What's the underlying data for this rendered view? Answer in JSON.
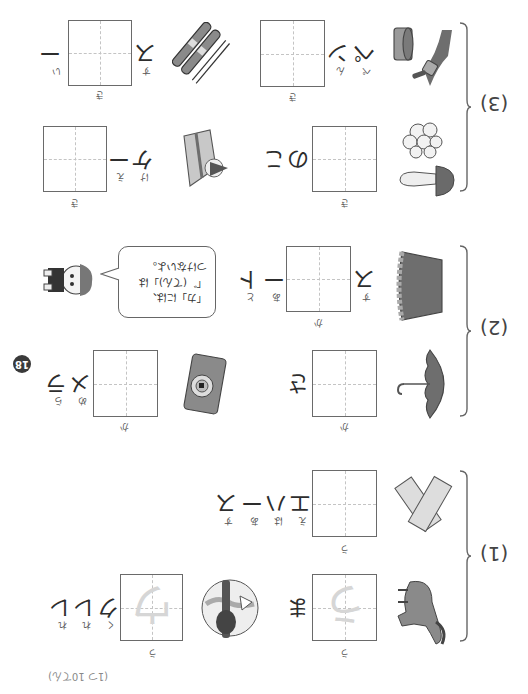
{
  "page": {
    "number": "18",
    "orientation": "rotated-180",
    "score_note": "(1つ 10てん)"
  },
  "sections": [
    {
      "label": "(1)",
      "items": [
        {
          "word": "ウま",
          "answer_kana": "ウ",
          "given": [
            "ま"
          ],
          "ruby_box": "う",
          "ruby_given": [
            ""
          ],
          "picture": "horse",
          "guide_glyph": "う"
        },
        {
          "word": "ウエハース",
          "answer_kana": "ウ",
          "given": [
            "エ",
            "ハ",
            "ー",
            "ス"
          ],
          "ruby_box": "う",
          "ruby_given": [
            "え",
            "は",
            "あ",
            "す"
          ],
          "picture": "wafers"
        },
        {
          "word": "ウクレレ",
          "answer_kana": "ウ",
          "given": [
            "ク",
            "レ",
            "レ"
          ],
          "ruby_box": "う",
          "ruby_given": [
            "く",
            "れ",
            "れ"
          ],
          "picture": "ukulele-player",
          "guide_glyph": "ウ"
        }
      ]
    },
    {
      "label": "(2)",
      "items": [
        {
          "word": "カさ",
          "answer_kana": "カ",
          "given": [
            "さ"
          ],
          "ruby_box": "か",
          "ruby_given": [
            ""
          ],
          "picture": "umbrella"
        },
        {
          "word": "スカート",
          "answer_kana": "カ",
          "given": [
            "ス",
            "ー",
            "ト"
          ],
          "ruby_box": "か",
          "ruby_given": [
            "す",
            "あ",
            "と"
          ],
          "picture": "skirt"
        },
        {
          "word": "カメラ",
          "answer_kana": "カ",
          "given": [
            "メ",
            "ラ"
          ],
          "ruby_box": "か",
          "ruby_given": [
            "め",
            "ら"
          ],
          "picture": "camera"
        }
      ],
      "speech_bubble": {
        "lines": [
          "「カ」には、",
          "「゛(てん)」は",
          "つけないよ。"
        ],
        "speaker": "child-character"
      }
    },
    {
      "label": "(3)",
      "items": [
        {
          "word": "キのこ",
          "answer_kana": "キ",
          "given": [
            "の",
            "こ"
          ],
          "ruby_box": "き",
          "ruby_given": [
            "",
            ""
          ],
          "picture": "mushrooms"
        },
        {
          "word": "ペンキ",
          "answer_kana": "キ",
          "given": [
            "ペ",
            "ン"
          ],
          "ruby_box": "き",
          "ruby_given": [
            "ぺ",
            "ん"
          ],
          "picture": "paint-can-brush"
        },
        {
          "word": "ケーキ",
          "answer_kana": "キ",
          "given": [
            "ケ",
            "ー"
          ],
          "ruby_box": "き",
          "ruby_given": [
            "け",
            "え"
          ],
          "picture": "cake-slice"
        },
        {
          "word": "スキー",
          "answer_kana": "キ",
          "given": [
            "ス",
            "ー"
          ],
          "ruby_box": "き",
          "ruby_given": [
            "す",
            "い"
          ],
          "picture": "skis"
        }
      ]
    }
  ],
  "colors": {
    "box_border": "#6a6a6a",
    "guide_lines": "#c4c4c4",
    "trace_glyph": "#d6d6d6",
    "badge_bg": "#3a3a3a",
    "illustration_dark": "#6e6e6e",
    "illustration_mid": "#9a9a9a"
  }
}
